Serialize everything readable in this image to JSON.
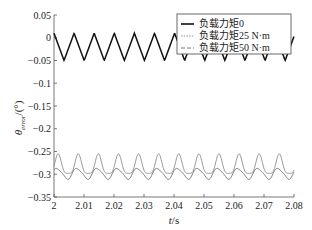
{
  "chart_data": {
    "type": "line",
    "title": "",
    "xlabel": "t/s",
    "ylabel": "θerror/(°)",
    "xlim": [
      2.0,
      2.08
    ],
    "ylim": [
      -0.35,
      0.05
    ],
    "xticks": [
      2,
      2.01,
      2.02,
      2.03,
      2.04,
      2.05,
      2.06,
      2.07,
      2.08
    ],
    "xtick_labels": [
      "2",
      "2.01",
      "2.02",
      "2.03",
      "2.04",
      "2.05",
      "2.06",
      "2.07",
      "2.08"
    ],
    "yticks": [
      0.05,
      0,
      -0.05,
      -0.1,
      -0.15,
      -0.2,
      -0.25,
      -0.3,
      -0.35
    ],
    "ytick_labels": [
      "0.05",
      "0",
      "−0.05",
      "−0.1",
      "−0.15",
      "−0.2",
      "−0.25",
      "−0.3",
      "−0.35"
    ],
    "grid": false,
    "legend_position": "upper right",
    "series": [
      {
        "name": "负载力矩0",
        "style": "solid-black",
        "period_s": 0.0067,
        "min": -0.05,
        "max": 0.01,
        "mean": -0.02
      },
      {
        "name": "负载力矩25 N·m",
        "style": "dotted-gray",
        "period_s": 0.0067,
        "min": -0.298,
        "max": -0.255,
        "mean": -0.28
      },
      {
        "name": "负载力矩50 N·m",
        "style": "dashed-gray",
        "period_s": 0.0067,
        "min": -0.312,
        "max": -0.285,
        "mean": -0.3
      }
    ]
  },
  "axes": {
    "xlabel_italic": "t",
    "xlabel_unit": "/s",
    "ylabel_symbol": "θ",
    "ylabel_sub": "error",
    "ylabel_unit": "/(°)"
  },
  "legend": {
    "items": [
      {
        "label": "负载力矩0"
      },
      {
        "label": "负载力矩25 N·m"
      },
      {
        "label": "负载力矩50 N·m"
      }
    ]
  }
}
